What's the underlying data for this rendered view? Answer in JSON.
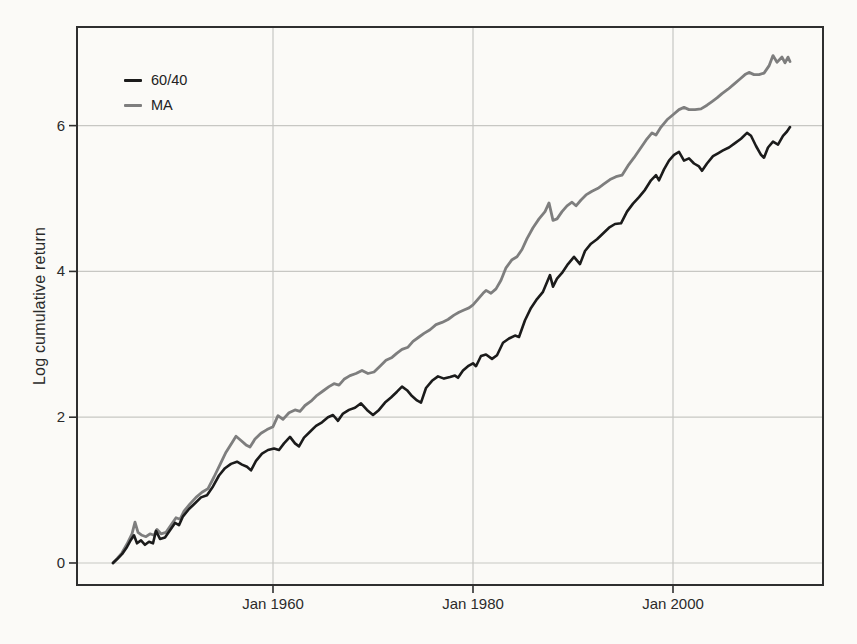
{
  "chart_data": {
    "type": "line",
    "title": "",
    "xlabel": "",
    "ylabel": "Log cumulative return",
    "grid": true,
    "legend_position": "top-left-inside",
    "xlim": [
      1940.4,
      2015.0
    ],
    "ylim": [
      -0.302,
      7.353
    ],
    "x_ticks": [
      {
        "value": 1960,
        "label": "Jan 1960"
      },
      {
        "value": 1980,
        "label": "Jan 1980"
      },
      {
        "value": 2000,
        "label": "Jan 2000"
      }
    ],
    "y_ticks": [
      {
        "value": 0,
        "label": "0"
      },
      {
        "value": 2,
        "label": "2"
      },
      {
        "value": 4,
        "label": "4"
      },
      {
        "value": 6,
        "label": "6"
      }
    ],
    "colors": {
      "grid": "#c7c7c3",
      "frame": "#2f2f2f",
      "text": "#2a2a2a",
      "paper": "#fbfaf7"
    },
    "series": [
      {
        "name": "60/40",
        "color": "#1b1b1b",
        "stroke_width": 2.6,
        "points": [
          [
            1944.0,
            0.0
          ],
          [
            1944.4,
            0.05
          ],
          [
            1944.9,
            0.12
          ],
          [
            1945.4,
            0.22
          ],
          [
            1945.8,
            0.32
          ],
          [
            1946.1,
            0.38
          ],
          [
            1946.4,
            0.27
          ],
          [
            1946.8,
            0.31
          ],
          [
            1947.2,
            0.25
          ],
          [
            1947.6,
            0.29
          ],
          [
            1948.0,
            0.27
          ],
          [
            1948.3,
            0.44
          ],
          [
            1948.7,
            0.33
          ],
          [
            1949.2,
            0.35
          ],
          [
            1949.7,
            0.45
          ],
          [
            1950.2,
            0.55
          ],
          [
            1950.6,
            0.52
          ],
          [
            1951.0,
            0.64
          ],
          [
            1951.6,
            0.74
          ],
          [
            1952.2,
            0.82
          ],
          [
            1952.8,
            0.9
          ],
          [
            1953.4,
            0.93
          ],
          [
            1954.0,
            1.05
          ],
          [
            1954.6,
            1.2
          ],
          [
            1955.2,
            1.3
          ],
          [
            1955.8,
            1.36
          ],
          [
            1956.4,
            1.39
          ],
          [
            1956.9,
            1.35
          ],
          [
            1957.4,
            1.32
          ],
          [
            1957.8,
            1.27
          ],
          [
            1958.3,
            1.4
          ],
          [
            1958.9,
            1.5
          ],
          [
            1959.5,
            1.55
          ],
          [
            1960.1,
            1.57
          ],
          [
            1960.6,
            1.55
          ],
          [
            1961.1,
            1.64
          ],
          [
            1961.7,
            1.73
          ],
          [
            1962.2,
            1.64
          ],
          [
            1962.6,
            1.6
          ],
          [
            1963.1,
            1.72
          ],
          [
            1963.7,
            1.8
          ],
          [
            1964.3,
            1.88
          ],
          [
            1964.9,
            1.93
          ],
          [
            1965.5,
            2.0
          ],
          [
            1966.0,
            2.03
          ],
          [
            1966.5,
            1.95
          ],
          [
            1967.0,
            2.05
          ],
          [
            1967.6,
            2.1
          ],
          [
            1968.2,
            2.13
          ],
          [
            1968.8,
            2.19
          ],
          [
            1969.4,
            2.1
          ],
          [
            1970.0,
            2.03
          ],
          [
            1970.6,
            2.1
          ],
          [
            1971.2,
            2.2
          ],
          [
            1971.8,
            2.27
          ],
          [
            1972.4,
            2.35
          ],
          [
            1972.9,
            2.42
          ],
          [
            1973.4,
            2.37
          ],
          [
            1973.9,
            2.29
          ],
          [
            1974.4,
            2.23
          ],
          [
            1974.8,
            2.2
          ],
          [
            1975.3,
            2.4
          ],
          [
            1975.9,
            2.5
          ],
          [
            1976.5,
            2.56
          ],
          [
            1977.1,
            2.53
          ],
          [
            1977.7,
            2.55
          ],
          [
            1978.2,
            2.57
          ],
          [
            1978.5,
            2.54
          ],
          [
            1979.0,
            2.64
          ],
          [
            1979.5,
            2.7
          ],
          [
            1980.0,
            2.74
          ],
          [
            1980.3,
            2.7
          ],
          [
            1980.8,
            2.84
          ],
          [
            1981.3,
            2.86
          ],
          [
            1981.9,
            2.8
          ],
          [
            1982.4,
            2.85
          ],
          [
            1983.0,
            3.02
          ],
          [
            1983.6,
            3.08
          ],
          [
            1984.2,
            3.12
          ],
          [
            1984.6,
            3.1
          ],
          [
            1985.2,
            3.33
          ],
          [
            1985.8,
            3.5
          ],
          [
            1986.4,
            3.62
          ],
          [
            1987.0,
            3.72
          ],
          [
            1987.7,
            3.95
          ],
          [
            1988.0,
            3.79
          ],
          [
            1988.4,
            3.9
          ],
          [
            1988.9,
            3.98
          ],
          [
            1989.5,
            4.1
          ],
          [
            1990.1,
            4.2
          ],
          [
            1990.7,
            4.1
          ],
          [
            1991.2,
            4.28
          ],
          [
            1991.8,
            4.38
          ],
          [
            1992.4,
            4.44
          ],
          [
            1993.0,
            4.52
          ],
          [
            1993.6,
            4.6
          ],
          [
            1994.2,
            4.65
          ],
          [
            1994.8,
            4.66
          ],
          [
            1995.4,
            4.82
          ],
          [
            1996.0,
            4.93
          ],
          [
            1996.6,
            5.02
          ],
          [
            1997.2,
            5.12
          ],
          [
            1997.8,
            5.25
          ],
          [
            1998.3,
            5.32
          ],
          [
            1998.6,
            5.25
          ],
          [
            1999.1,
            5.4
          ],
          [
            1999.6,
            5.52
          ],
          [
            2000.1,
            5.6
          ],
          [
            2000.6,
            5.64
          ],
          [
            2001.1,
            5.52
          ],
          [
            2001.6,
            5.55
          ],
          [
            2002.1,
            5.48
          ],
          [
            2002.6,
            5.44
          ],
          [
            2002.9,
            5.38
          ],
          [
            2003.4,
            5.48
          ],
          [
            2004.0,
            5.58
          ],
          [
            2004.5,
            5.62
          ],
          [
            2005.0,
            5.66
          ],
          [
            2005.6,
            5.7
          ],
          [
            2006.2,
            5.76
          ],
          [
            2006.8,
            5.82
          ],
          [
            2007.4,
            5.9
          ],
          [
            2007.8,
            5.86
          ],
          [
            2008.3,
            5.72
          ],
          [
            2008.8,
            5.6
          ],
          [
            2009.1,
            5.56
          ],
          [
            2009.5,
            5.7
          ],
          [
            2010.0,
            5.78
          ],
          [
            2010.5,
            5.74
          ],
          [
            2011.0,
            5.86
          ],
          [
            2011.4,
            5.92
          ],
          [
            2011.7,
            5.98
          ]
        ]
      },
      {
        "name": "MA",
        "color": "#7e7e7e",
        "stroke_width": 2.8,
        "points": [
          [
            1944.0,
            0.0
          ],
          [
            1944.4,
            0.06
          ],
          [
            1944.9,
            0.14
          ],
          [
            1945.4,
            0.26
          ],
          [
            1945.9,
            0.4
          ],
          [
            1946.2,
            0.56
          ],
          [
            1946.5,
            0.42
          ],
          [
            1946.9,
            0.38
          ],
          [
            1947.3,
            0.36
          ],
          [
            1947.7,
            0.4
          ],
          [
            1948.1,
            0.38
          ],
          [
            1948.4,
            0.46
          ],
          [
            1948.8,
            0.4
          ],
          [
            1949.3,
            0.42
          ],
          [
            1949.8,
            0.52
          ],
          [
            1950.3,
            0.62
          ],
          [
            1950.7,
            0.6
          ],
          [
            1951.1,
            0.71
          ],
          [
            1951.7,
            0.81
          ],
          [
            1952.3,
            0.9
          ],
          [
            1952.9,
            0.97
          ],
          [
            1953.5,
            1.02
          ],
          [
            1954.1,
            1.18
          ],
          [
            1954.7,
            1.35
          ],
          [
            1955.3,
            1.52
          ],
          [
            1955.9,
            1.65
          ],
          [
            1956.3,
            1.74
          ],
          [
            1956.8,
            1.68
          ],
          [
            1957.3,
            1.62
          ],
          [
            1957.7,
            1.59
          ],
          [
            1958.2,
            1.7
          ],
          [
            1958.8,
            1.78
          ],
          [
            1959.4,
            1.83
          ],
          [
            1960.0,
            1.87
          ],
          [
            1960.5,
            2.02
          ],
          [
            1961.0,
            1.97
          ],
          [
            1961.6,
            2.06
          ],
          [
            1962.2,
            2.1
          ],
          [
            1962.7,
            2.08
          ],
          [
            1963.2,
            2.16
          ],
          [
            1963.8,
            2.22
          ],
          [
            1964.4,
            2.3
          ],
          [
            1965.0,
            2.36
          ],
          [
            1965.6,
            2.42
          ],
          [
            1966.1,
            2.46
          ],
          [
            1966.6,
            2.44
          ],
          [
            1967.1,
            2.52
          ],
          [
            1967.7,
            2.57
          ],
          [
            1968.3,
            2.6
          ],
          [
            1968.9,
            2.64
          ],
          [
            1969.5,
            2.6
          ],
          [
            1970.1,
            2.62
          ],
          [
            1970.7,
            2.7
          ],
          [
            1971.3,
            2.78
          ],
          [
            1971.9,
            2.82
          ],
          [
            1972.4,
            2.88
          ],
          [
            1972.9,
            2.93
          ],
          [
            1973.5,
            2.96
          ],
          [
            1974.0,
            3.04
          ],
          [
            1974.6,
            3.1
          ],
          [
            1975.1,
            3.15
          ],
          [
            1975.7,
            3.2
          ],
          [
            1976.3,
            3.27
          ],
          [
            1976.9,
            3.3
          ],
          [
            1977.5,
            3.34
          ],
          [
            1978.1,
            3.4
          ],
          [
            1978.6,
            3.44
          ],
          [
            1979.1,
            3.47
          ],
          [
            1979.6,
            3.5
          ],
          [
            1980.0,
            3.54
          ],
          [
            1980.5,
            3.62
          ],
          [
            1981.0,
            3.7
          ],
          [
            1981.3,
            3.74
          ],
          [
            1981.8,
            3.7
          ],
          [
            1982.3,
            3.76
          ],
          [
            1982.8,
            3.88
          ],
          [
            1983.3,
            4.05
          ],
          [
            1983.9,
            4.16
          ],
          [
            1984.4,
            4.2
          ],
          [
            1984.9,
            4.3
          ],
          [
            1985.4,
            4.45
          ],
          [
            1986.0,
            4.6
          ],
          [
            1986.6,
            4.72
          ],
          [
            1987.2,
            4.82
          ],
          [
            1987.6,
            4.94
          ],
          [
            1988.0,
            4.7
          ],
          [
            1988.4,
            4.72
          ],
          [
            1988.9,
            4.82
          ],
          [
            1989.4,
            4.9
          ],
          [
            1989.9,
            4.95
          ],
          [
            1990.3,
            4.9
          ],
          [
            1990.8,
            4.98
          ],
          [
            1991.3,
            5.05
          ],
          [
            1991.9,
            5.1
          ],
          [
            1992.5,
            5.14
          ],
          [
            1993.1,
            5.2
          ],
          [
            1993.7,
            5.26
          ],
          [
            1994.3,
            5.3
          ],
          [
            1994.9,
            5.32
          ],
          [
            1995.5,
            5.45
          ],
          [
            1996.1,
            5.56
          ],
          [
            1996.7,
            5.68
          ],
          [
            1997.3,
            5.8
          ],
          [
            1997.9,
            5.9
          ],
          [
            1998.3,
            5.87
          ],
          [
            1998.8,
            5.98
          ],
          [
            1999.4,
            6.08
          ],
          [
            2000.0,
            6.15
          ],
          [
            2000.6,
            6.22
          ],
          [
            2001.1,
            6.25
          ],
          [
            2001.6,
            6.22
          ],
          [
            2002.2,
            6.22
          ],
          [
            2002.8,
            6.23
          ],
          [
            2003.4,
            6.28
          ],
          [
            2003.9,
            6.33
          ],
          [
            2004.4,
            6.38
          ],
          [
            2004.9,
            6.44
          ],
          [
            2005.5,
            6.5
          ],
          [
            2006.1,
            6.57
          ],
          [
            2006.7,
            6.64
          ],
          [
            2007.2,
            6.7
          ],
          [
            2007.6,
            6.73
          ],
          [
            2008.1,
            6.7
          ],
          [
            2008.6,
            6.7
          ],
          [
            2009.1,
            6.72
          ],
          [
            2009.6,
            6.82
          ],
          [
            2010.0,
            6.96
          ],
          [
            2010.4,
            6.87
          ],
          [
            2010.9,
            6.94
          ],
          [
            2011.2,
            6.86
          ],
          [
            2011.5,
            6.94
          ],
          [
            2011.7,
            6.88
          ]
        ]
      }
    ]
  },
  "legend": {
    "items": [
      {
        "label": "60/40"
      },
      {
        "label": "MA"
      }
    ]
  }
}
